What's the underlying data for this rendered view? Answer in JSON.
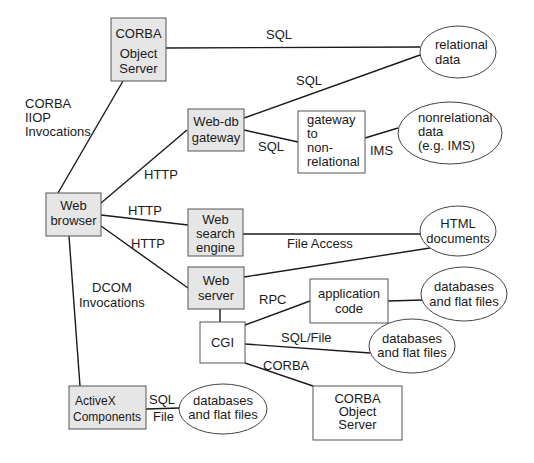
{
  "nodes": {
    "corba_server_top": {
      "lines": [
        "CORBA",
        "Object",
        "Server"
      ]
    },
    "relational_data": {
      "lines": [
        "relational",
        "data"
      ]
    },
    "webdb_gateway": {
      "lines": [
        "Web-db",
        "gateway"
      ]
    },
    "gateway_nonrel": {
      "lines": [
        "gateway",
        "to",
        "non-",
        "relational"
      ]
    },
    "nonrelational_data": {
      "lines": [
        "nonrelational",
        "data",
        "(e.g. IMS)"
      ]
    },
    "web_browser": {
      "lines": [
        "Web",
        "browser"
      ]
    },
    "web_search_engine": {
      "lines": [
        "Web",
        "search",
        "engine"
      ]
    },
    "html_documents": {
      "lines": [
        "HTML",
        "documents"
      ]
    },
    "web_server": {
      "lines": [
        "Web",
        "server"
      ]
    },
    "application_code": {
      "lines": [
        "application",
        "code"
      ]
    },
    "db_flat_app": {
      "lines": [
        "databases",
        "and flat files"
      ]
    },
    "cgi": {
      "lines": [
        "CGI"
      ]
    },
    "db_flat_cgi": {
      "lines": [
        "databases",
        "and flat files"
      ]
    },
    "corba_server_bottom": {
      "lines": [
        "CORBA",
        "Object",
        "Server"
      ]
    },
    "activex": {
      "lines": [
        "ActiveX",
        "Components"
      ]
    },
    "db_flat_activex": {
      "lines": [
        "databases",
        "and flat files"
      ]
    }
  },
  "edge_labels": {
    "sql_top": "SQL",
    "corba_iiop": [
      "CORBA",
      "IIOP",
      "Invocations"
    ],
    "sql_webdb_rel": "SQL",
    "sql_webdb_gw": "SQL",
    "ims": "IMS",
    "http_webdb": "HTTP",
    "http_search": "HTTP",
    "http_server": "HTTP",
    "file_access": "File Access",
    "dcom": [
      "DCOM",
      "Invocations"
    ],
    "rpc": "RPC",
    "sql_file": "SQL/File",
    "corba_cgi": "CORBA",
    "activex_sql": "SQL",
    "activex_file": "File"
  }
}
